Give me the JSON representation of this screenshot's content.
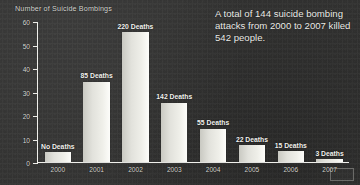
{
  "chart_data": {
    "type": "bar",
    "title": "Number of Suicide Bombings",
    "ylabel": "Number of Suicide Bombings",
    "xlabel": "",
    "categories": [
      "2000",
      "2001",
      "2002",
      "2003",
      "2004",
      "2005",
      "2006",
      "2007"
    ],
    "values": [
      4,
      34,
      55,
      25,
      14,
      7,
      4.5,
      1
    ],
    "point_labels": [
      "No Deaths",
      "85 Deaths",
      "220 Deaths",
      "142 Deaths",
      "55 Deaths",
      "22 Deaths",
      "15 Deaths",
      "3 Deaths"
    ],
    "deaths": [
      0,
      85,
      220,
      142,
      55,
      22,
      15,
      3
    ],
    "ylim": [
      0,
      60
    ],
    "yticks": [
      0,
      10,
      20,
      30,
      40,
      50,
      60
    ],
    "ytick_labels": [
      "0",
      "10",
      "20",
      "30",
      "40",
      "50",
      "60"
    ],
    "grid": false,
    "legend": null,
    "annotation": "A total of 144 suicide bombing attacks from 2000 to 2007 killed 542 people."
  },
  "figure": {
    "axis_title": "Number of Suicide Bombings",
    "caption": "A total of 144 suicide bombing attacks from 2000 to 2007 killed 542 people.",
    "colors": {
      "background": "#30302f",
      "bar_fill": "#eeeee8",
      "axis": "#f0f0ec",
      "text": "#e8e8e8"
    }
  }
}
